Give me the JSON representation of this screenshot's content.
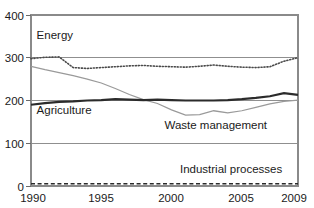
{
  "chart_data": {
    "type": "line",
    "title": "",
    "xlabel": "",
    "ylabel": "",
    "xlim": [
      1990,
      2009
    ],
    "ylim": [
      0,
      400
    ],
    "grid": true,
    "legend": "inline-annotations",
    "x": [
      1990,
      1991,
      1992,
      1993,
      1994,
      1995,
      1996,
      1997,
      1998,
      1999,
      2000,
      2001,
      2002,
      2003,
      2004,
      2005,
      2006,
      2007,
      2008,
      2009
    ],
    "xticks": [
      "1990",
      "1995",
      "2000",
      "2005",
      "2009"
    ],
    "yticks": [
      "0",
      "100",
      "200",
      "300",
      "400"
    ],
    "series": [
      {
        "name": "Energy",
        "style": "dotted",
        "color": "#4a4a4a",
        "values": [
          298,
          301,
          302,
          277,
          275,
          277,
          279,
          281,
          282,
          280,
          279,
          278,
          280,
          283,
          280,
          278,
          277,
          279,
          292,
          300
        ]
      },
      {
        "name": "Waste management",
        "style": "solid-thin",
        "color": "#9a9a9a",
        "values": [
          280,
          272,
          265,
          258,
          250,
          241,
          228,
          214,
          202,
          193,
          178,
          166,
          167,
          176,
          171,
          176,
          184,
          192,
          198,
          201
        ]
      },
      {
        "name": "Agriculture",
        "style": "solid-thick",
        "color": "#2b2b2b",
        "values": [
          190,
          194,
          197,
          198,
          200,
          201,
          203,
          202,
          201,
          202,
          201,
          200,
          200,
          200,
          201,
          203,
          206,
          210,
          217,
          213
        ]
      },
      {
        "name": "Industrial processes",
        "style": "dashed",
        "color": "#2b2b2b",
        "values": [
          5,
          5,
          5,
          5,
          5,
          5,
          5,
          5,
          5,
          5,
          5,
          5,
          5,
          5,
          5,
          5,
          5,
          5,
          5,
          5
        ]
      }
    ],
    "annotations": [
      {
        "text": "Energy",
        "x": 1990.4,
        "y": 345
      },
      {
        "text": "Agriculture",
        "x": 1990.4,
        "y": 168
      },
      {
        "text": "Waste management",
        "x": 1999.5,
        "y": 133
      },
      {
        "text": "Industrial processes",
        "x": 2000.6,
        "y": 30
      }
    ]
  }
}
